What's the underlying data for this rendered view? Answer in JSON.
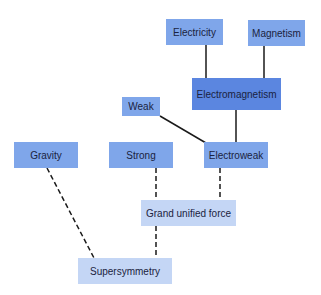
{
  "diagram": {
    "title": "",
    "colors": {
      "primary": "#7fa6ea",
      "emphasis": "#5b86e0",
      "light": "#c4d6f5",
      "link": "#1a1a1a",
      "text": "#1a2340"
    },
    "nodes": [
      {
        "id": "electricity",
        "label": "Electricity",
        "x": 166,
        "y": 19,
        "w": 57,
        "h": 26,
        "style": "primary"
      },
      {
        "id": "magnetism",
        "label": "Magnetism",
        "x": 248,
        "y": 20,
        "w": 57,
        "h": 26,
        "style": "primary"
      },
      {
        "id": "electromagnetism",
        "label": "Electromagnetism",
        "x": 192,
        "y": 78,
        "w": 89,
        "h": 32,
        "style": "emphasis"
      },
      {
        "id": "weak",
        "label": "Weak",
        "x": 122,
        "y": 97,
        "w": 38,
        "h": 19,
        "style": "primary"
      },
      {
        "id": "gravity",
        "label": "Gravity",
        "x": 14,
        "y": 142,
        "w": 64,
        "h": 26,
        "style": "primary"
      },
      {
        "id": "strong",
        "label": "Strong",
        "x": 109,
        "y": 142,
        "w": 64,
        "h": 26,
        "style": "primary"
      },
      {
        "id": "electroweak",
        "label": "Electroweak",
        "x": 204,
        "y": 142,
        "w": 64,
        "h": 26,
        "style": "primary"
      },
      {
        "id": "guf",
        "label": "Grand unified force",
        "x": 141,
        "y": 200,
        "w": 95,
        "h": 26,
        "style": "light"
      },
      {
        "id": "supersymmetry",
        "label": "Supersymmetry",
        "x": 78,
        "y": 258,
        "w": 94,
        "h": 26,
        "style": "light"
      }
    ],
    "links": [
      {
        "from": "electricity",
        "to": "electromagnetism",
        "x1": 206,
        "y1": 45,
        "x2": 206,
        "y2": 78,
        "dashed": false
      },
      {
        "from": "magnetism",
        "to": "electromagnetism",
        "x1": 264,
        "y1": 46,
        "x2": 264,
        "y2": 78,
        "dashed": false
      },
      {
        "from": "electromagnetism",
        "to": "electroweak",
        "x1": 236,
        "y1": 110,
        "x2": 236,
        "y2": 142,
        "dashed": false
      },
      {
        "from": "weak",
        "to": "electroweak",
        "x1": 160,
        "y1": 116,
        "x2": 206,
        "y2": 143,
        "dashed": false
      },
      {
        "from": "strong",
        "to": "guf",
        "x1": 156,
        "y1": 168,
        "x2": 156,
        "y2": 200,
        "dashed": true
      },
      {
        "from": "electroweak",
        "to": "guf",
        "x1": 220,
        "y1": 168,
        "x2": 220,
        "y2": 200,
        "dashed": true
      },
      {
        "from": "guf",
        "to": "supersymmetry",
        "x1": 156,
        "y1": 226,
        "x2": 156,
        "y2": 258,
        "dashed": true
      },
      {
        "from": "gravity",
        "to": "supersymmetry",
        "x1": 47,
        "y1": 168,
        "x2": 94,
        "y2": 258,
        "dashed": true
      }
    ]
  }
}
